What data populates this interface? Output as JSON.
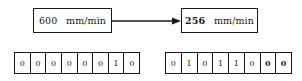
{
  "diagram": {
    "source_box": {
      "number": "600",
      "unit": "mm/min",
      "full_text": "600 mm/min",
      "emphasis": false
    },
    "target_box": {
      "number": "256",
      "unit": "mm/min",
      "full_text": "256 mm/min",
      "emphasis": true
    },
    "arrow": {
      "icon": "arrow-right-icon",
      "direction": "right"
    },
    "bytes": {
      "left": {
        "bits": [
          {
            "value": "0",
            "bold": false
          },
          {
            "value": "0",
            "bold": false
          },
          {
            "value": "0",
            "bold": false
          },
          {
            "value": "0",
            "bold": false
          },
          {
            "value": "0",
            "bold": false
          },
          {
            "value": "0",
            "bold": false
          },
          {
            "value": "1",
            "bold": false
          },
          {
            "value": "0",
            "bold": false
          }
        ]
      },
      "right": {
        "bits": [
          {
            "value": "0",
            "bold": false
          },
          {
            "value": "1",
            "bold": false
          },
          {
            "value": "0",
            "bold": false
          },
          {
            "value": "1",
            "bold": false
          },
          {
            "value": "1",
            "bold": false
          },
          {
            "value": "0",
            "bold": false
          },
          {
            "value": "0",
            "bold": true
          },
          {
            "value": "0",
            "bold": true
          }
        ]
      }
    },
    "colors": {
      "stroke": "#1a1a1a",
      "background": "#ffffff",
      "text": "#1a1a1a"
    }
  }
}
